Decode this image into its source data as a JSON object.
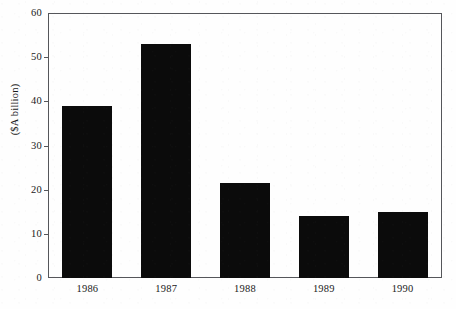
{
  "chart_data": {
    "type": "bar",
    "title": "",
    "xlabel": "",
    "ylabel": "($A billion)",
    "categories": [
      "1986",
      "1987",
      "1988",
      "1989",
      "1990"
    ],
    "values": [
      39,
      53,
      21.5,
      14,
      15
    ],
    "ylim": [
      0,
      60
    ],
    "yticks": [
      0,
      10,
      20,
      30,
      40,
      50,
      60
    ],
    "ytick_labels": [
      "0",
      "10",
      "20",
      "30",
      "40",
      "50",
      "60"
    ],
    "grid": false,
    "legend": null,
    "bar_color": "#0b0b0b",
    "axis_color": "#55565a",
    "background_color": "#fefefe"
  }
}
